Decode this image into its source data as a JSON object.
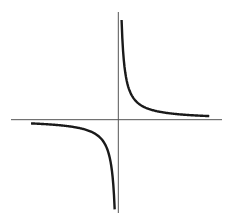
{
  "chart_data": {
    "type": "line",
    "title": "",
    "xlabel": "",
    "ylabel": "",
    "function": "y = 1/x",
    "xlim": [
      -5.9,
      5.7
    ],
    "ylim": [
      -5.2,
      6.0
    ],
    "grid": false,
    "legend": "none",
    "series": [
      {
        "name": "right-branch",
        "x": [
          0.18,
          0.25,
          0.35,
          0.5,
          0.75,
          1,
          1.5,
          2,
          2.5,
          3,
          3.5,
          4,
          4.5,
          5
        ],
        "y": [
          5.56,
          4.0,
          2.86,
          2.0,
          1.33,
          1.0,
          0.67,
          0.5,
          0.4,
          0.33,
          0.29,
          0.25,
          0.22,
          0.2
        ]
      },
      {
        "name": "left-branch",
        "x": [
          -4.8,
          -4.5,
          -4,
          -3.5,
          -3,
          -2.5,
          -2,
          -1.5,
          -1,
          -0.75,
          -0.5,
          -0.35,
          -0.25,
          -0.2
        ],
        "y": [
          -0.21,
          -0.22,
          -0.25,
          -0.29,
          -0.33,
          -0.4,
          -0.5,
          -0.67,
          -1.0,
          -1.33,
          -2.0,
          -2.86,
          -4.0,
          -5.0
        ]
      }
    ],
    "colors": {
      "axis": "#555555",
      "curve": "#1a1a1a"
    }
  }
}
